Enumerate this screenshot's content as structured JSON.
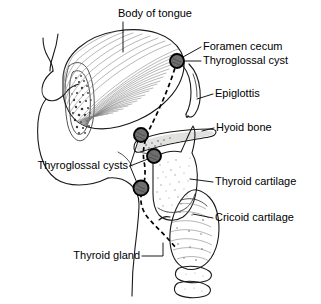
{
  "diagram": {
    "colors": {
      "ink": "#1a1a1a",
      "hatch": "#7d7d7d",
      "cartilage_fill": "#ededea",
      "gland_fill": "#8f8f8f",
      "cyst_fill": "#6e6e6e",
      "background": "#ffffff"
    },
    "labels": [
      {
        "id": "body-of-tongue",
        "text": "Body of tongue",
        "x": 155,
        "y": 14,
        "anchor": "middle"
      },
      {
        "id": "foramen-cecum",
        "text": "Foramen cecum",
        "x": 203,
        "y": 47,
        "anchor": "start"
      },
      {
        "id": "thyroglossal-cyst",
        "text": "Thyroglossal cyst",
        "x": 203,
        "y": 61,
        "anchor": "start"
      },
      {
        "id": "epiglottis",
        "text": "Epiglottis",
        "x": 215,
        "y": 94,
        "anchor": "start"
      },
      {
        "id": "hyoid-bone",
        "text": "Hyoid bone",
        "x": 216,
        "y": 128,
        "anchor": "start"
      },
      {
        "id": "thyroglossal-cysts",
        "text": "Thyroglossal cysts",
        "x": 128,
        "y": 166,
        "anchor": "end"
      },
      {
        "id": "thyroid-cartilage",
        "text": "Thyroid cartilage",
        "x": 215,
        "y": 182,
        "anchor": "start"
      },
      {
        "id": "cricoid-cartilage",
        "text": "Cricoid cartilage",
        "x": 215,
        "y": 218,
        "anchor": "start"
      },
      {
        "id": "thyroid-gland",
        "text": "Thyroid gland",
        "x": 140,
        "y": 256,
        "anchor": "end"
      }
    ],
    "cysts": [
      {
        "id": "cyst-foramen-cecum",
        "cx": 177,
        "cy": 61,
        "r": 7.0
      },
      {
        "id": "cyst-suprahyoid",
        "cx": 141,
        "cy": 135,
        "r": 7.0
      },
      {
        "id": "cyst-infrahyoid",
        "cx": 154,
        "cy": 156,
        "r": 7.0
      },
      {
        "id": "cyst-pretracheal",
        "cx": 141,
        "cy": 188,
        "r": 7.5
      }
    ],
    "structures": [
      {
        "id": "tongue",
        "name": "Body of tongue"
      },
      {
        "id": "epiglottis-flap",
        "name": "Epiglottis"
      },
      {
        "id": "hyoid",
        "name": "Hyoid bone"
      },
      {
        "id": "thyroid-cartilage",
        "name": "Thyroid cartilage"
      },
      {
        "id": "cricoid-cartilage",
        "name": "Cricoid cartilage"
      },
      {
        "id": "thyroid-gland",
        "name": "Thyroid gland"
      },
      {
        "id": "trachea-rings",
        "name": "Tracheal rings"
      },
      {
        "id": "facial-profile",
        "name": "Facial profile"
      },
      {
        "id": "thyroglossal-tract",
        "name": "Thyroglossal duct tract"
      }
    ]
  }
}
